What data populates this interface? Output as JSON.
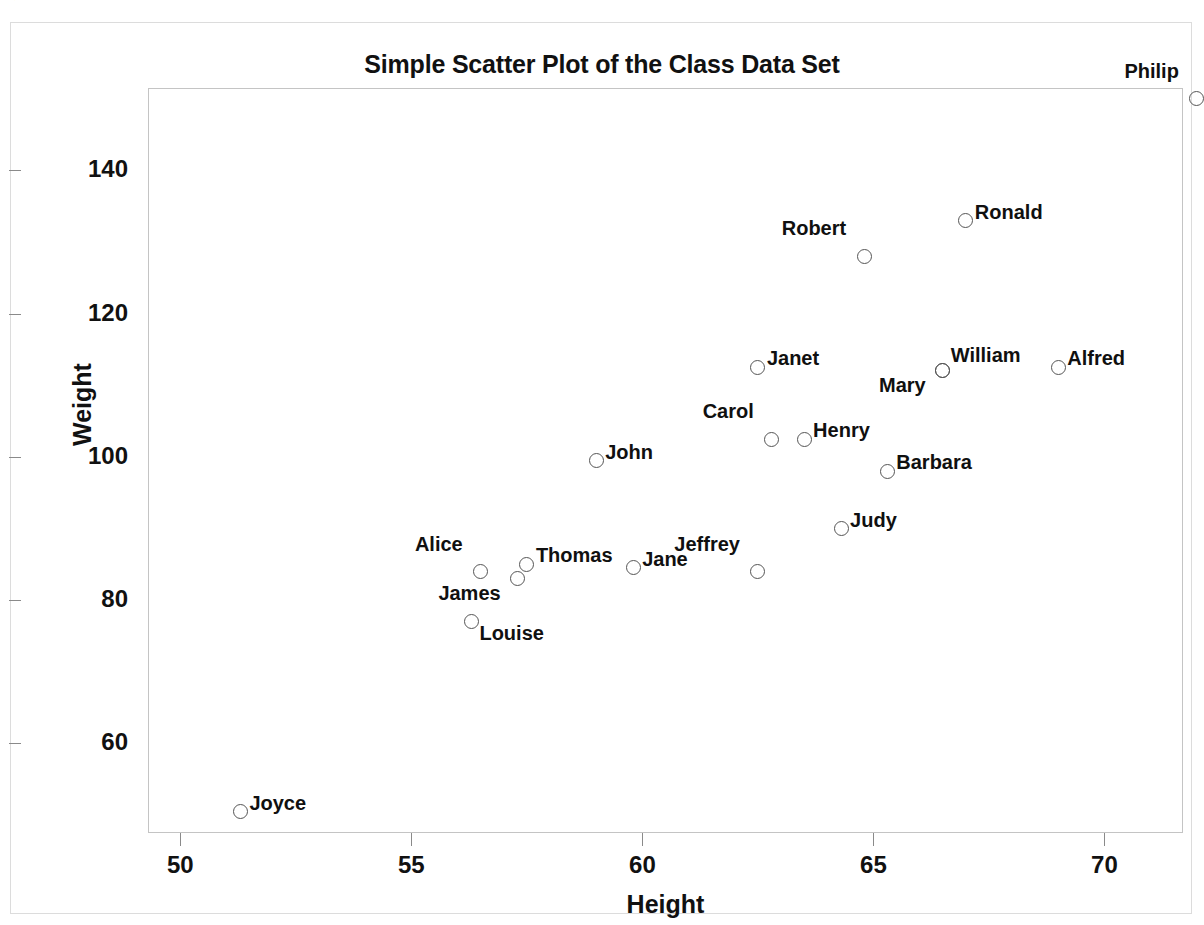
{
  "page": {
    "top_strip_note": "",
    "background_color": "#ffffff"
  },
  "chart_data": {
    "type": "scatter",
    "title": "Simple Scatter Plot of the Class Data Set",
    "xlabel": "Height",
    "ylabel": "Weight",
    "xlim": [
      49.3,
      71.7
    ],
    "ylim": [
      47.5,
      151.5
    ],
    "xticks": [
      50,
      55,
      60,
      65,
      70
    ],
    "yticks": [
      60,
      80,
      100,
      120,
      140
    ],
    "grid": false,
    "legend": "none",
    "marker_style": "open-circle",
    "marker_color": "#555555",
    "points": [
      {
        "label": "Alfred",
        "x": 69.0,
        "y": 112.5,
        "label_pos": "right"
      },
      {
        "label": "Alice",
        "x": 56.5,
        "y": 84.0,
        "label_pos": "left"
      },
      {
        "label": "Barbara",
        "x": 65.3,
        "y": 98.0,
        "label_pos": "right"
      },
      {
        "label": "Carol",
        "x": 62.8,
        "y": 102.5,
        "label_pos": "left"
      },
      {
        "label": "Henry",
        "x": 63.5,
        "y": 102.5,
        "label_pos": "right"
      },
      {
        "label": "James",
        "x": 57.3,
        "y": 83.0,
        "label_pos": "below-left"
      },
      {
        "label": "Jane",
        "x": 59.8,
        "y": 84.5,
        "label_pos": "right"
      },
      {
        "label": "Janet",
        "x": 62.5,
        "y": 112.5,
        "label_pos": "right"
      },
      {
        "label": "Jeffrey",
        "x": 62.5,
        "y": 84.0,
        "label_pos": "left"
      },
      {
        "label": "John",
        "x": 59.0,
        "y": 99.5,
        "label_pos": "right"
      },
      {
        "label": "Joyce",
        "x": 51.3,
        "y": 50.5,
        "label_pos": "right"
      },
      {
        "label": "Judy",
        "x": 64.3,
        "y": 90.0,
        "label_pos": "right"
      },
      {
        "label": "Louise",
        "x": 56.3,
        "y": 77.0,
        "label_pos": "below-right"
      },
      {
        "label": "Mary",
        "x": 66.5,
        "y": 112.0,
        "label_pos": "below-left"
      },
      {
        "label": "Philip",
        "x": 72.0,
        "y": 150.0,
        "label_pos": "left"
      },
      {
        "label": "Robert",
        "x": 64.8,
        "y": 128.0,
        "label_pos": "left"
      },
      {
        "label": "Ronald",
        "x": 67.0,
        "y": 133.0,
        "label_pos": "right"
      },
      {
        "label": "Thomas",
        "x": 57.5,
        "y": 85.0,
        "label_pos": "right"
      },
      {
        "label": "William",
        "x": 66.5,
        "y": 112.0,
        "label_pos": "above-right"
      }
    ]
  }
}
